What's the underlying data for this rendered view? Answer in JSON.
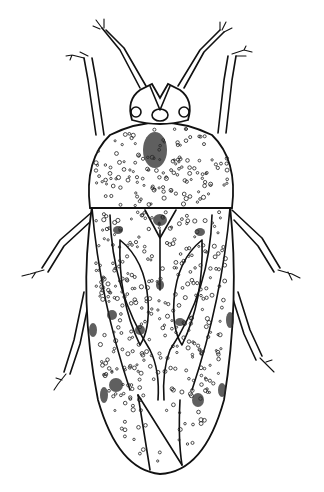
{
  "image": {
    "subject": "insect-illustration",
    "style": "black-and-white stippled line drawing",
    "view": "dorsal",
    "colors": {
      "background": "#ffffff",
      "ink": "#111111"
    }
  }
}
